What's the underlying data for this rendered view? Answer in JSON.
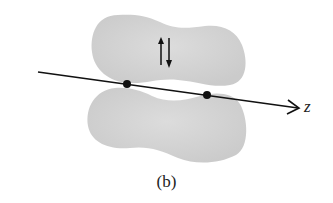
{
  "diagram": {
    "axis_label": "z",
    "caption": "(b)",
    "electron_spins": [
      "up",
      "down"
    ],
    "nuclei_count": 2,
    "colors": {
      "lobe": "#d3d3d3",
      "line": "#111111",
      "background": "#ffffff"
    }
  }
}
